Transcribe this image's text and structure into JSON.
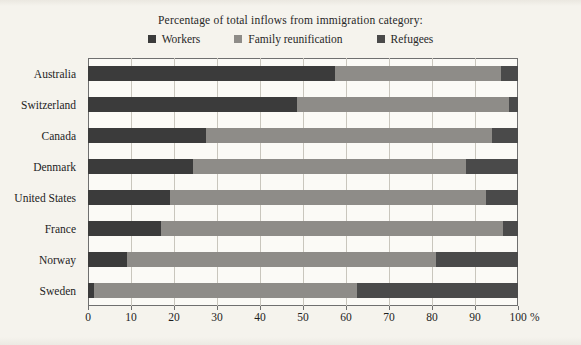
{
  "chart_data": {
    "type": "bar",
    "orientation": "horizontal",
    "stacked": true,
    "title": "Percentage of total inflows from immigration category:",
    "xlabel": "",
    "ylabel": "",
    "xunit": "%",
    "xlim": [
      0,
      100
    ],
    "xticks": [
      0,
      10,
      20,
      30,
      40,
      50,
      60,
      70,
      80,
      90,
      100
    ],
    "xtick_labels": [
      "0",
      "10",
      "20",
      "30",
      "40",
      "50",
      "60",
      "70",
      "80",
      "90",
      "100"
    ],
    "grid": true,
    "legend_position": "top",
    "categories": [
      "Australia",
      "Switzerland",
      "Canada",
      "Denmark",
      "United States",
      "France",
      "Norway",
      "Sweden"
    ],
    "series": [
      {
        "name": "Workers",
        "color": "#3b3b3b",
        "values": [
          57.5,
          48.5,
          27.5,
          24.5,
          19.0,
          17.0,
          9.0,
          1.5
        ]
      },
      {
        "name": "Family reunification",
        "color": "#8e8c88",
        "values": [
          38.5,
          49.5,
          66.5,
          63.5,
          73.5,
          79.5,
          72.0,
          61.0
        ]
      },
      {
        "name": "Refugees",
        "color": "#4a4a4a",
        "values": [
          4.0,
          2.0,
          6.0,
          12.0,
          7.5,
          3.5,
          19.0,
          37.5
        ]
      }
    ]
  },
  "legend": {
    "items": [
      {
        "label": "Workers",
        "color": "#3b3b3b"
      },
      {
        "label": "Family reunification",
        "color": "#8e8c88"
      },
      {
        "label": "Refugees",
        "color": "#4a4a4a"
      }
    ]
  },
  "colors": {
    "workers": "#3b3b3b",
    "family": "#8e8c88",
    "refugees": "#4a4a4a",
    "page_background": "#f5f3ed",
    "plot_background": "#fbfaf6",
    "axis": "#6f6f6f",
    "gridline": "#c9c6bd",
    "text": "#1d1d1d"
  }
}
